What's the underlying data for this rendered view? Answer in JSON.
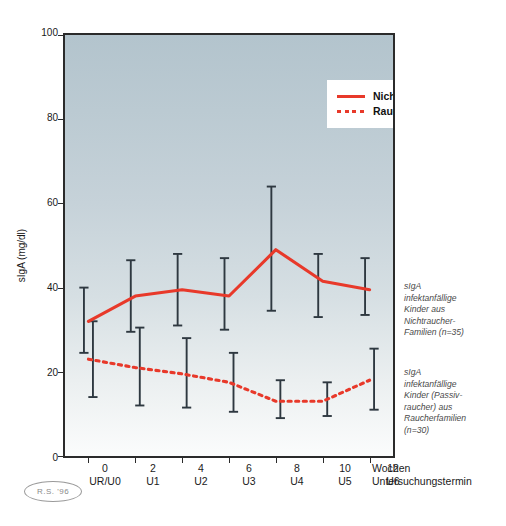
{
  "chart_data": {
    "type": "line",
    "title": "",
    "xlabel": "Wochen / Untersuchungstermin",
    "ylabel": "sIgA (mg/dl)",
    "ylim": [
      0,
      100
    ],
    "xlim": [
      -1,
      13
    ],
    "yticks": [
      0,
      20,
      40,
      60,
      80,
      100
    ],
    "ytick_labels": [
      "0",
      "20",
      "40",
      "60",
      "80",
      "100"
    ],
    "x": [
      0,
      2,
      4,
      6,
      8,
      10,
      12
    ],
    "xtick_weeks": [
      "0",
      "2",
      "4",
      "6",
      "8",
      "10",
      "12"
    ],
    "xtick_visits": [
      "UR/U0",
      "U1",
      "U2",
      "U3",
      "U4",
      "U5",
      "U6"
    ],
    "grid": false,
    "legend_position": "top-right",
    "series": [
      {
        "name": "Nichtraucher (n=35)",
        "style": "solid",
        "color": "#e8392a",
        "values": [
          32,
          38,
          39.5,
          38,
          49,
          41.5,
          39.5
        ],
        "err_low": [
          24.5,
          29.5,
          31,
          30,
          34.5,
          33,
          33.5
        ],
        "err_high": [
          40,
          46.5,
          48,
          47,
          64,
          48,
          47
        ]
      },
      {
        "name": "Raucher (n=30)",
        "style": "dashed",
        "color": "#e8392a",
        "values": [
          23,
          21,
          19.5,
          17.5,
          13,
          13,
          18
        ],
        "err_low": [
          14,
          12,
          11.5,
          10.5,
          9,
          9.5,
          11
        ],
        "err_high": [
          32,
          30.5,
          28,
          24.5,
          18,
          17.5,
          25.5
        ]
      }
    ]
  },
  "legend": {
    "items": [
      {
        "label": "Nichtraucher (n=35)",
        "style": "solid"
      },
      {
        "label": "Raucher (n=30)",
        "style": "dashed"
      }
    ]
  },
  "annotations": {
    "nonsmoker": "sIgA infektanfällige Kinder aus Nichtraucher-Familien (n=35)",
    "smoker": "sIgA infektanfällige Kinder (Passiv-raucher) aus Raucherfamilien (n=30)",
    "nonsmoker_lines": [
      "sIgA",
      "infektanfällige",
      "Kinder aus",
      "Nichtraucher-",
      "Familien (n=35)"
    ],
    "smoker_lines": [
      "sIgA",
      "infektanfällige",
      "Kinder (Passiv-",
      "raucher) aus",
      "Raucherfamilien",
      "(n=30)"
    ]
  },
  "axis": {
    "y_title": "sIgA (mg/dl)",
    "x_unit_week": "Wochen",
    "x_unit_term": "Untersuchungstermin"
  },
  "stamp": {
    "text": "R.S. '96"
  },
  "colors": {
    "series_red": "#e8392a",
    "errorbar": "#2e3840",
    "frame": "#2b2b2b",
    "bg_top": "#b3c4cd",
    "bg_bottom": "#fbfcfc"
  }
}
